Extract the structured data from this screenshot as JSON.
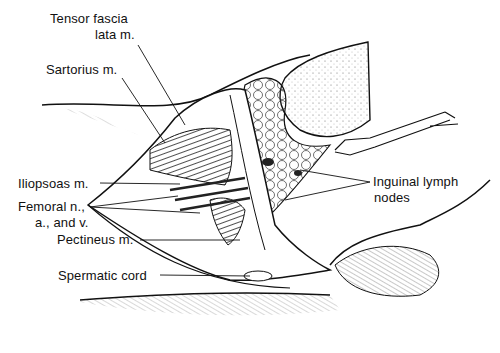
{
  "figure": {
    "type": "anatomical-illustration",
    "labels": {
      "tensor_fascia_line1": "Tensor fascia",
      "tensor_fascia_line2": "lata m.",
      "sartorius": "Sartorius m.",
      "iliopsoas": "Iliopsoas m.",
      "femoral_line1": "Femoral n.,",
      "femoral_line2": "a., and v.",
      "pectineus": "Pectineus m.",
      "spermatic_cord": "Spermatic cord",
      "inguinal_line1": "Inguinal lymph",
      "inguinal_line2": "nodes"
    },
    "colors": {
      "ink": "#111111",
      "background": "#ffffff"
    }
  }
}
